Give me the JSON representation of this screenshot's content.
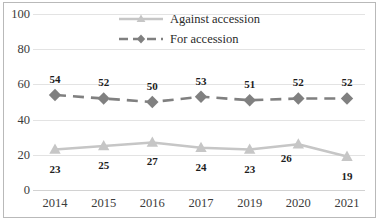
{
  "chart_data": {
    "type": "line",
    "title": "",
    "subtitle": "",
    "xlabel": "",
    "ylabel": "",
    "categories": [
      "2014",
      "2015",
      "2016",
      "2017",
      "2019",
      "2020",
      "2021"
    ],
    "series": [
      {
        "name": "Against accession",
        "values": [
          23,
          25,
          27,
          24,
          23,
          26,
          19
        ],
        "color": "#c6c6c6",
        "marker": "triangle",
        "linestyle": "solid",
        "label_positions": [
          "below",
          "below",
          "below",
          "below",
          "below",
          "below-left",
          "below"
        ]
      },
      {
        "name": "For accession",
        "values": [
          54,
          52,
          50,
          53,
          51,
          52,
          52
        ],
        "color": "#808080",
        "marker": "diamond",
        "linestyle": "dashed",
        "label_positions": [
          "above",
          "above",
          "above",
          "above",
          "above",
          "above",
          "above"
        ]
      }
    ],
    "ylim": [
      0,
      100
    ],
    "yticks": [
      0,
      20,
      40,
      60,
      80,
      100
    ],
    "ytick_labels": [
      "0",
      "20",
      "40",
      "60",
      "80",
      "100"
    ],
    "grid": true,
    "grid_axis": "y",
    "legend_position": "top-center",
    "legend_entries": [
      "Against accession",
      "For accession"
    ],
    "data_labels_visible": true,
    "frame_color": "#b9b9b9",
    "grid_color": "#e3e3e3",
    "text_color": "#3b3b3b"
  }
}
